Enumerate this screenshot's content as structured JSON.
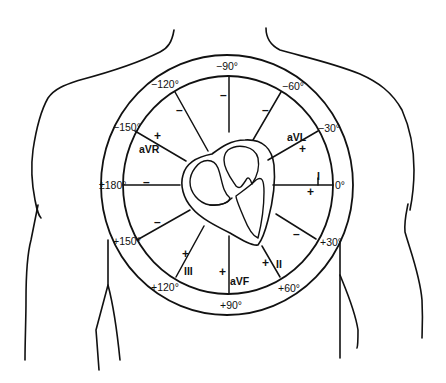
{
  "diagram": {
    "colors": {
      "ink": "#111111",
      "background": "#ffffff"
    },
    "angle_labels": {
      "m90": "−90°",
      "m60": "−60°",
      "m30": "−30°",
      "zero": "0°",
      "p30": "+30°",
      "p60": "+60°",
      "p90": "+90°",
      "p120": "+120°",
      "p150": "+150°",
      "pm180": "±180°",
      "m150": "−150°",
      "m120": "−120°"
    },
    "leads": {
      "aVR": "aVR",
      "aVL": "aVL",
      "I": "I",
      "II": "II",
      "III": "III",
      "aVF": "aVF"
    },
    "signs": {
      "plus": "+",
      "minus": "–"
    },
    "axes": [
      {
        "angle": "0°",
        "lead": "I",
        "positive_pole": "0°",
        "negative_pole": "±180°"
      },
      {
        "angle": "+60°",
        "lead": "II",
        "positive_pole": "+60°",
        "negative_pole": "−120°"
      },
      {
        "angle": "+120°",
        "lead": "III",
        "positive_pole": "+120°",
        "negative_pole": "−60°"
      },
      {
        "angle": "−150°",
        "lead": "aVR",
        "positive_pole": "−150°",
        "negative_pole": "+30°"
      },
      {
        "angle": "−30°",
        "lead": "aVL",
        "positive_pole": "−30°",
        "negative_pole": "+150°"
      },
      {
        "angle": "+90°",
        "lead": "aVF",
        "positive_pole": "+90°",
        "negative_pole": "−90°"
      }
    ]
  }
}
